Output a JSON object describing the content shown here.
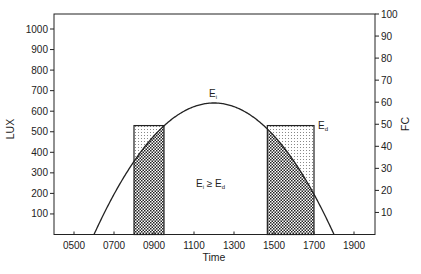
{
  "chart_data": {
    "type": "line",
    "title": "",
    "xlabel": "Time",
    "ylabel_left": "LUX",
    "ylabel_right": "FC",
    "x_ticks": [
      "0500",
      "0700",
      "0900",
      "1100",
      "1300",
      "1500",
      "1700",
      "1900"
    ],
    "x_range_hours": [
      4,
      20
    ],
    "y_left_ticks": [
      100,
      200,
      300,
      400,
      500,
      600,
      700,
      800,
      900,
      1000
    ],
    "y_left_range": [
      0,
      1100
    ],
    "y_right_ticks": [
      10,
      20,
      30,
      40,
      50,
      60,
      70,
      80,
      90,
      100
    ],
    "y_right_range": [
      0,
      100
    ],
    "series": [
      {
        "name": "E_i (daylight illuminance)",
        "kind": "curve",
        "points": [
          {
            "time": "0600",
            "lux": 0
          },
          {
            "time": "0800",
            "lux": 380
          },
          {
            "time": "0930",
            "lux": 550
          },
          {
            "time": "1200",
            "lux": 640
          },
          {
            "time": "1440",
            "lux": 540
          },
          {
            "time": "1700",
            "lux": 230
          },
          {
            "time": "1800",
            "lux": 0
          }
        ]
      },
      {
        "name": "E_d (design illuminance)",
        "kind": "rectangles",
        "level_lux": 530,
        "intervals": [
          {
            "start": "0800",
            "end": "0930"
          },
          {
            "start": "1440",
            "end": "1700"
          }
        ]
      }
    ],
    "annotations": [
      {
        "text": "E_i",
        "position": "above curve peak"
      },
      {
        "text": "E_d",
        "position": "right of right rectangle"
      },
      {
        "text": "E_i ≥ E_d",
        "position": "center under curve"
      }
    ],
    "grid": false,
    "legend": "none"
  },
  "labels": {
    "xlabel": "Time",
    "ylabel_left": "LUX",
    "ylabel_right": "FC",
    "ei": "E",
    "ei_sub": "i",
    "ed": "E",
    "ed_sub": "d",
    "center_main": "E",
    "center_sub1": "i",
    "center_op": " ≥ E",
    "center_sub2": "d"
  }
}
